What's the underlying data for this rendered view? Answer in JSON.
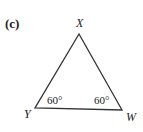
{
  "figure": {
    "part_label": "(c)",
    "shape": "triangle",
    "vertices": {
      "top": {
        "label": "X"
      },
      "bottom_left": {
        "label": "Y",
        "angle": "60°"
      },
      "bottom_right": {
        "label": "W",
        "angle": "60°"
      }
    },
    "line_color": "#333333"
  }
}
